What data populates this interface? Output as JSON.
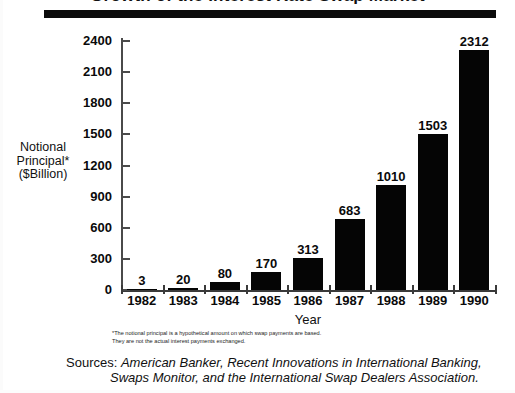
{
  "title": "Growth of the Interest Rate Swap Market",
  "chart_data": {
    "type": "bar",
    "title": "Growth of the Interest Rate Swap Market",
    "categories": [
      "1982",
      "1983",
      "1984",
      "1985",
      "1986",
      "1987",
      "1988",
      "1989",
      "1990"
    ],
    "values": [
      3,
      20,
      80,
      170,
      313,
      683,
      1010,
      1503,
      2312
    ],
    "value_labels": [
      "3",
      "20",
      "80",
      "170",
      "313",
      "683",
      "1010",
      "1503",
      "2312"
    ],
    "xlabel": "Year",
    "ylabel": "Notional Principal* ($Billion)",
    "ylim": [
      0,
      2400
    ],
    "yticks": [
      0,
      300,
      600,
      900,
      1200,
      1500,
      1800,
      2100,
      2400
    ],
    "ytick_labels": [
      "0",
      "300",
      "600",
      "900",
      "1200",
      "1500",
      "1800",
      "2100",
      "2400"
    ],
    "grid": false,
    "legend": false,
    "bar_color": "#050505",
    "axis_color": "#3a3a3a"
  },
  "axis": {
    "y_title_line1": "Notional",
    "y_title_line2": "Principal*",
    "y_title_line3": "($Billion)",
    "x_title": "Year"
  },
  "footnote": {
    "line1": "*The notional principal is a hypothetical amount on which swap payments are based.",
    "line2": "They are not the actual interest payments exchanged."
  },
  "sources": {
    "label": "Sources:",
    "italic_line1": "American Banker, Recent Innovations in International Banking,",
    "italic_line2": "Swaps Monitor, and the International Swap Dealers Association."
  }
}
